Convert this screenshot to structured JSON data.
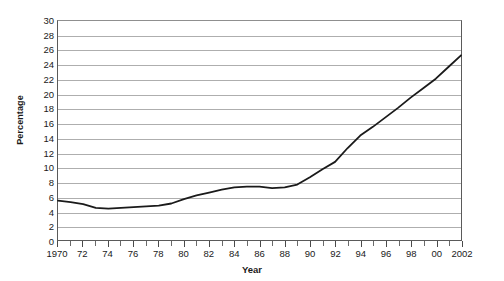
{
  "chart_data": {
    "type": "line",
    "title": "",
    "xlabel": "Year",
    "ylabel": "Percentage",
    "xlim": [
      1970,
      2002
    ],
    "ylim": [
      0,
      30
    ],
    "ytick_step": 2,
    "grid": true,
    "legend": false,
    "yticks": [
      30,
      28,
      26,
      24,
      22,
      20,
      18,
      16,
      14,
      12,
      10,
      8,
      6,
      4,
      2,
      0
    ],
    "xticks": [
      1970,
      1971,
      1972,
      1973,
      1974,
      1975,
      1976,
      1977,
      1978,
      1979,
      1980,
      1981,
      1982,
      1983,
      1984,
      1985,
      1986,
      1987,
      1988,
      1989,
      1990,
      1991,
      1992,
      1993,
      1994,
      1995,
      1996,
      1997,
      1998,
      1999,
      2000,
      2001,
      2002
    ],
    "xtick_labels": [
      {
        "x": 1970,
        "label": "1970"
      },
      {
        "x": 1972,
        "label": "72"
      },
      {
        "x": 1974,
        "label": "74"
      },
      {
        "x": 1976,
        "label": "76"
      },
      {
        "x": 1978,
        "label": "78"
      },
      {
        "x": 1980,
        "label": "80"
      },
      {
        "x": 1982,
        "label": "82"
      },
      {
        "x": 1984,
        "label": "84"
      },
      {
        "x": 1986,
        "label": "86"
      },
      {
        "x": 1988,
        "label": "88"
      },
      {
        "x": 1990,
        "label": "90"
      },
      {
        "x": 1992,
        "label": "92"
      },
      {
        "x": 1994,
        "label": "94"
      },
      {
        "x": 1996,
        "label": "96"
      },
      {
        "x": 1998,
        "label": "98"
      },
      {
        "x": 2000,
        "label": "00"
      },
      {
        "x": 2002,
        "label": "2002"
      }
    ],
    "series": [
      {
        "name": "Percentage",
        "color": "#1a1a1a",
        "line_width": 1.8,
        "x": [
          1970,
          1971,
          1972,
          1973,
          1974,
          1975,
          1976,
          1977,
          1978,
          1979,
          1980,
          1981,
          1982,
          1983,
          1984,
          1985,
          1986,
          1987,
          1988,
          1989,
          1990,
          1991,
          1992,
          1993,
          1994,
          1995,
          1996,
          1997,
          1998,
          1999,
          2000,
          2001,
          2002
        ],
        "values": [
          5.4,
          5.2,
          4.9,
          4.4,
          4.3,
          4.4,
          4.5,
          4.6,
          4.7,
          5.0,
          5.6,
          6.1,
          6.5,
          6.9,
          7.2,
          7.3,
          7.3,
          7.1,
          7.2,
          7.6,
          8.6,
          9.7,
          10.7,
          12.6,
          14.3,
          15.5,
          16.8,
          18.1,
          19.5,
          20.8,
          22.1,
          23.7,
          25.3
        ]
      }
    ]
  }
}
